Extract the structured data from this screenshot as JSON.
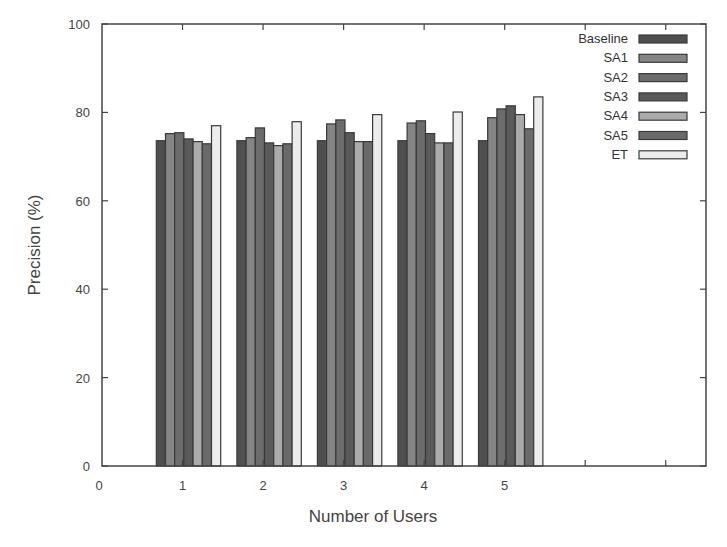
{
  "chart_data": {
    "type": "bar",
    "title": "",
    "xlabel": "Number of Users",
    "ylabel": "Precision  (%)",
    "ylim": [
      0,
      100
    ],
    "xlim": [
      0,
      7.5
    ],
    "yticks": [
      0,
      20,
      40,
      60,
      80,
      100
    ],
    "xticks": [
      0,
      1,
      2,
      3,
      4,
      5,
      6,
      7
    ],
    "xtick_labels": [
      "0",
      "1",
      "2",
      "3",
      "4",
      "5",
      "",
      ""
    ],
    "categories": [
      "1",
      "2",
      "3",
      "4",
      "5"
    ],
    "grid": false,
    "legend_position": "top-right",
    "series": [
      {
        "name": "Baseline",
        "color": "#4f4f4f",
        "values": [
          73.6,
          73.6,
          73.6,
          73.6,
          73.6
        ]
      },
      {
        "name": "SA1",
        "color": "#858585",
        "values": [
          75.2,
          74.3,
          77.4,
          77.6,
          78.8
        ]
      },
      {
        "name": "SA2",
        "color": "#6c6c6c",
        "values": [
          75.4,
          76.5,
          78.3,
          78.1,
          80.8
        ]
      },
      {
        "name": "SA3",
        "color": "#5a5a5a",
        "values": [
          74.0,
          73.1,
          75.4,
          75.2,
          81.5
        ]
      },
      {
        "name": "SA4",
        "color": "#ababab",
        "values": [
          73.4,
          72.5,
          73.4,
          73.1,
          79.5
        ]
      },
      {
        "name": "SA5",
        "color": "#6a6a6a",
        "values": [
          72.9,
          72.9,
          73.4,
          73.1,
          76.3
        ]
      },
      {
        "name": "ET",
        "color": "#ececec",
        "values": [
          77.0,
          77.9,
          79.5,
          80.1,
          83.5
        ]
      }
    ]
  }
}
